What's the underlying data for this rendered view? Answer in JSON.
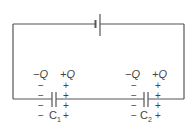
{
  "diagram": {
    "battery": {
      "name": "battery"
    },
    "capacitors": [
      {
        "label": "C",
        "subscript": "1",
        "left_charge": "−Q",
        "right_charge": "+Q",
        "left_sign": "−",
        "right_sign": "+"
      },
      {
        "label": "C",
        "subscript": "2",
        "left_charge": "−Q",
        "right_charge": "+Q",
        "left_sign": "−",
        "right_sign": "+"
      }
    ],
    "colors": {
      "wire": "#555555",
      "text": "#444444"
    }
  }
}
